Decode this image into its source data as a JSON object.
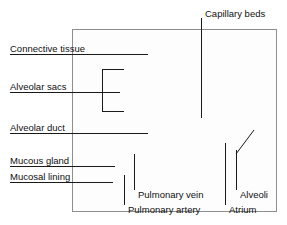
{
  "figure": {
    "style": "grayscale anatomical illustration with leader-line callouts",
    "frame_color": "#8e8e8e",
    "tissue_color": "#a8a8a8",
    "leader_color": "#1a1a1a"
  },
  "labels": {
    "connective_tissue": "Connective tissue",
    "alveolar_sacs": "Alveolar sacs",
    "alveolar_duct": "Alveolar duct",
    "mucous_gland": "Mucous gland",
    "mucosal_lining": "Mucosal lining",
    "capillary_beds": "Capillary beds",
    "pulmonary_vein": "Pulmonary vein",
    "pulmonary_artery": "Pulmonary artery",
    "alveoli": "Alveoli",
    "atrium": "Atrium"
  }
}
